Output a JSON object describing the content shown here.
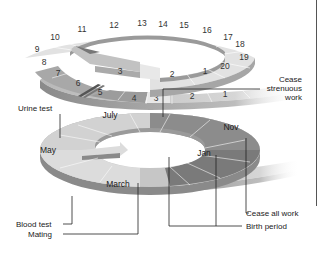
{
  "diagram": {
    "type": "spiral-calendar",
    "colors": {
      "light": "#e4e4e4",
      "mid": "#b8b8b8",
      "dark": "#8e8e8e",
      "darker": "#6c6c6c",
      "side_light": "#c2c2c2",
      "side_dark": "#7a7a7a",
      "line": "#222222"
    },
    "upper_ring": {
      "week_numbers": [
        "1",
        "2",
        "3",
        "4",
        "5",
        "6",
        "7",
        "8",
        "9",
        "10",
        "11",
        "12",
        "13",
        "14",
        "15",
        "16",
        "17",
        "18",
        "19",
        "20"
      ],
      "outer_tail_numbers": [
        "3",
        "2",
        "1"
      ]
    },
    "lower_ring": {
      "months": [
        "July",
        "May",
        "March",
        "Nov",
        "Jan"
      ]
    },
    "labels": {
      "cease_strenuous": [
        "Cease",
        "strenuous",
        "work"
      ],
      "urine_test": "Urine test",
      "blood_test": "Blood test",
      "mating": "Mating",
      "cease_all_work": "Cease all work",
      "birth_period": "Birth period"
    }
  }
}
